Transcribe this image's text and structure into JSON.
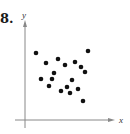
{
  "problem_number": "8.",
  "chart_data": {
    "type": "scatter",
    "title": "",
    "xlabel": "x",
    "ylabel": "y",
    "grid": false,
    "ticks": "none",
    "points_pixel": [
      [
        36,
        53
      ],
      [
        88,
        51
      ],
      [
        46,
        63
      ],
      [
        58,
        59
      ],
      [
        65,
        65
      ],
      [
        75,
        62
      ],
      [
        81,
        67
      ],
      [
        85,
        72
      ],
      [
        54,
        73
      ],
      [
        41,
        79
      ],
      [
        52,
        79
      ],
      [
        72,
        80
      ],
      [
        49,
        86
      ],
      [
        67,
        87
      ],
      [
        61,
        91
      ],
      [
        78,
        89
      ],
      [
        70,
        93
      ],
      [
        83,
        101
      ]
    ],
    "point_color": "#111111",
    "axis_color": "#888888"
  }
}
